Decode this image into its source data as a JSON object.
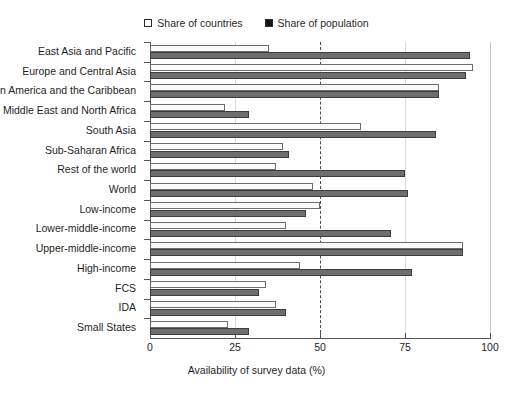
{
  "top_cut_text": "",
  "legend": {
    "position": "top-center",
    "items": [
      {
        "label": "Share of countries",
        "swatch": "hollow-square-icon",
        "color": "#ffffff"
      },
      {
        "label": "Share of population",
        "swatch": "filled-square-icon",
        "color": "#161616"
      }
    ]
  },
  "chart_data": {
    "type": "bar",
    "orientation": "horizontal",
    "title": "",
    "subtitle": "",
    "xlabel": "Availability of survey data (%)",
    "ylabel": "",
    "xlim": [
      0,
      100
    ],
    "xticks": [
      0,
      25,
      50,
      75,
      100
    ],
    "xticklabels": [
      "0",
      "25",
      "50",
      "75",
      "100"
    ],
    "grid": true,
    "reference_line": {
      "value": 50,
      "style": "dashed",
      "color": "#4a4a4a"
    },
    "legend_position": "top-center",
    "categories": [
      "East Asia and Pacific",
      "Europe and Central Asia",
      "Latin America and the Caribbean",
      "Middle East and North Africa",
      "South Asia",
      "Sub-Saharan Africa",
      "Rest of the world",
      "World",
      "Low-income",
      "Lower-middle-income",
      "Upper-middle-income",
      "High-income",
      "FCS",
      "IDA",
      "Small States"
    ],
    "series": [
      {
        "name": "Share of countries",
        "color": "#ffffff",
        "edgecolor": "#6d6d6d",
        "values": [
          35,
          95,
          85,
          22,
          62,
          39,
          37,
          48,
          50,
          40,
          92,
          44,
          34,
          37,
          23
        ]
      },
      {
        "name": "Share of population",
        "color": "#6e6e6e",
        "edgecolor": "#3d3d3d",
        "values": [
          94,
          93,
          85,
          29,
          84,
          41,
          75,
          76,
          46,
          71,
          92,
          77,
          32,
          40,
          29
        ]
      }
    ]
  },
  "colors": {
    "axis": "#555555",
    "grid": "#dadada",
    "text": "#1f1f1f",
    "background": "#ffffff"
  }
}
